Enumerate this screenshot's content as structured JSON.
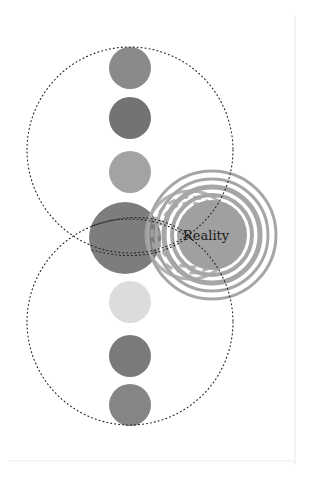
{
  "diagram": {
    "label": "Reality",
    "colors": {
      "background": "#ffffff",
      "circle_1": "#8a8a8a",
      "circle_2": "#737373",
      "circle_3": "#a3a3a3",
      "circle_4": "#7d7d7d",
      "circle_5": "#dcdcdc",
      "circle_6": "#7a7a7a",
      "circle_7": "#858585",
      "rings": "#a6a6a6",
      "reality_core": "#a0a0a0",
      "dotted_line": "#222222",
      "text": "#1a1a1a"
    },
    "column_circles": [
      {
        "id": "circle-1",
        "cy": 68,
        "r": 21
      },
      {
        "id": "circle-2",
        "cy": 118,
        "r": 21
      },
      {
        "id": "circle-3",
        "cy": 172,
        "r": 21
      },
      {
        "id": "circle-4",
        "cy": 238,
        "r": 37
      },
      {
        "id": "circle-5",
        "cy": 302,
        "r": 21
      },
      {
        "id": "circle-6",
        "cy": 356,
        "r": 21
      },
      {
        "id": "circle-7",
        "cy": 405,
        "r": 21
      }
    ]
  }
}
